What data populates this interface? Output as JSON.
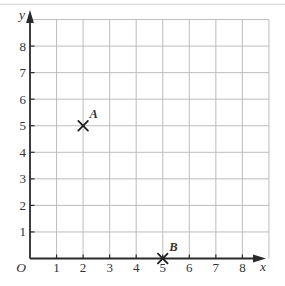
{
  "chart_data": {
    "type": "scatter",
    "title": "",
    "xlabel": "x",
    "ylabel": "y",
    "origin_label": "O",
    "x_ticks": [
      1,
      2,
      3,
      4,
      5,
      6,
      7,
      8
    ],
    "y_ticks": [
      1,
      2,
      3,
      4,
      5,
      6,
      7,
      8
    ],
    "xlim": [
      0,
      9
    ],
    "ylim": [
      0,
      9
    ],
    "grid": true,
    "legend": false,
    "points": [
      {
        "label": "A",
        "x": 2,
        "y": 5,
        "marker": "x-cross"
      },
      {
        "label": "B",
        "x": 5,
        "y": 0,
        "marker": "x-cross"
      }
    ],
    "colors": {
      "background": "#ffffff",
      "grid": "#b6b6b6",
      "axis": "#2a2a2a",
      "text": "#333333",
      "marker": "#1d1d1d",
      "scan_artifact": "#dcdcdc"
    }
  }
}
